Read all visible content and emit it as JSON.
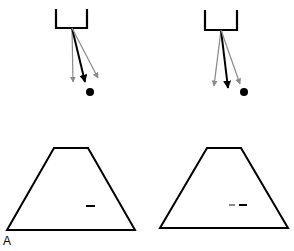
{
  "figure": {
    "panel_label": "A",
    "colors": {
      "stroke": "#000000",
      "gray_arrow": "#8a8a8a",
      "black_arrow": "#000000",
      "background": "#ffffff"
    },
    "panels": [
      {
        "name": "left",
        "cup": {
          "left_x": 56,
          "right_x": 87,
          "top_y": 9,
          "bottom_y": 28
        },
        "arrow_origin": [
          72,
          28
        ],
        "arrows": [
          {
            "color": "gray",
            "end": [
              73,
              82
            ]
          },
          {
            "color": "black",
            "end": [
              85,
              82
            ]
          },
          {
            "color": "gray",
            "end": [
              98,
              78
            ]
          }
        ],
        "target_dot": [
          90,
          92
        ],
        "trapezoid": {
          "top": [
            [
              54,
              148
            ],
            [
              88,
              148
            ]
          ],
          "bottom": [
            [
              7,
              230
            ],
            [
              135,
              230
            ]
          ]
        },
        "dashes": [
          {
            "color": "black",
            "x1": 86,
            "x2": 95,
            "y": 206
          }
        ]
      },
      {
        "name": "right",
        "cup": {
          "left_x": 205,
          "right_x": 237,
          "top_y": 10,
          "bottom_y": 30
        },
        "arrow_origin": [
          221,
          30
        ],
        "arrows": [
          {
            "color": "gray",
            "end": [
              214,
              86
            ]
          },
          {
            "color": "black",
            "end": [
              228,
              88
            ]
          },
          {
            "color": "gray",
            "end": [
              240,
              84
            ]
          }
        ],
        "target_dot": [
          244,
          92
        ],
        "trapezoid": {
          "top": [
            [
              207,
              148
            ],
            [
              241,
              148
            ]
          ],
          "bottom": [
            [
              160,
              228
            ],
            [
              288,
              228
            ]
          ]
        },
        "dashes": [
          {
            "color": "gray",
            "x1": 229,
            "x2": 235,
            "y": 205
          },
          {
            "color": "black",
            "x1": 239,
            "x2": 247,
            "y": 205
          }
        ]
      }
    ]
  }
}
